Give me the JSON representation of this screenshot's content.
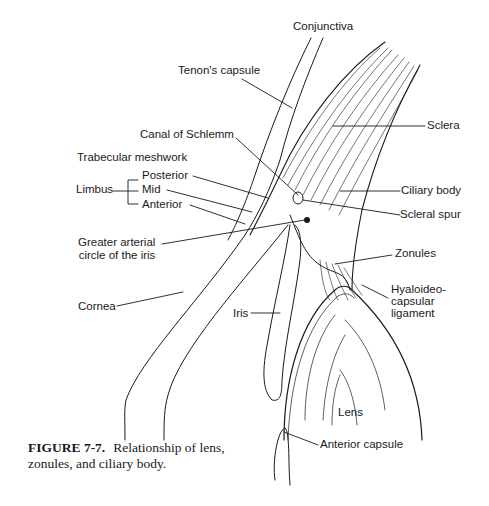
{
  "figure": {
    "number": "FIGURE 7-7.",
    "caption": "Relationship of lens, zonules, and ciliary body."
  },
  "labels": {
    "conjunctiva": "Conjunctiva",
    "tenons_capsule": "Tenon's capsule",
    "canal_of_schlemm": "Canal of Schlemm",
    "trabecular_meshwork": "Trabecular meshwork",
    "limbus": "Limbus",
    "posterior": "Posterior",
    "mid": "Mid",
    "anterior": "Anterior",
    "greater_arterial_1": "Greater arterial",
    "greater_arterial_2": "circle of the iris",
    "cornea": "Cornea",
    "iris": "Iris",
    "sclera": "Sclera",
    "ciliary_body": "Ciliary body",
    "scleral_spur": "Scleral spur",
    "zonules": "Zonules",
    "hyaloideo_1": "Hyaloideo-",
    "hyaloideo_2": "capsular",
    "hyaloideo_3": "ligament",
    "lens": "Lens",
    "anterior_capsule": "Anterior capsule"
  }
}
